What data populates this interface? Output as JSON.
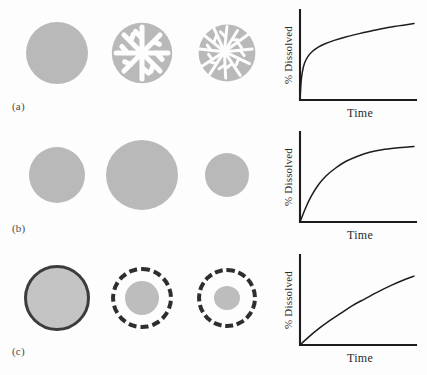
{
  "figure": {
    "panels": [
      {
        "label": "(a)",
        "mechanism": "erosion-fragmentation",
        "stages": [
          "intact-particle",
          "eroding-particle-radial-channels",
          "fragmented-particle"
        ]
      },
      {
        "label": "(b)",
        "mechanism": "swelling-then-shrinking",
        "stages": [
          "initial-particle",
          "swollen-particle",
          "shrunken-particle"
        ]
      },
      {
        "label": "(c)",
        "mechanism": "reservoir-membrane-diffusion",
        "stages": [
          "solid-membrane-sphere",
          "dashed-membrane-large-core",
          "dashed-membrane-small-core"
        ]
      }
    ],
    "colors": {
      "particle_fill": "#b9b9b9",
      "membrane_stroke": "#2e2e2e",
      "axis": "#1d1d1d",
      "background": "#fdfdfd"
    }
  },
  "chart_data": [
    {
      "type": "line",
      "title": "",
      "panel": "(a)",
      "xlabel": "Time",
      "ylabel": "% Dissolved",
      "xlim": [
        0,
        100
      ],
      "ylim": [
        0,
        100
      ],
      "grid": false,
      "legend": false,
      "description": "burst release: very steep initial rise then slow gradual increase",
      "x": [
        0,
        1,
        2,
        4,
        7,
        11,
        16,
        22,
        30,
        40,
        52,
        65,
        80,
        100
      ],
      "y": [
        0,
        22,
        33,
        44,
        52,
        58,
        63,
        67,
        71,
        75,
        79,
        83,
        87,
        91
      ]
    },
    {
      "type": "line",
      "title": "",
      "panel": "(b)",
      "xlabel": "Time",
      "ylabel": "% Dissolved",
      "xlim": [
        0,
        100
      ],
      "ylim": [
        0,
        100
      ],
      "grid": false,
      "legend": false,
      "description": "first-order release rising smoothly from origin and plateauing",
      "x": [
        0,
        5,
        10,
        16,
        23,
        31,
        40,
        50,
        61,
        72,
        84,
        100
      ],
      "y": [
        0,
        17,
        31,
        44,
        55,
        64,
        72,
        78,
        83,
        86,
        88,
        90
      ]
    },
    {
      "type": "line",
      "title": "",
      "panel": "(c)",
      "xlabel": "Time",
      "ylabel": "% Dissolved",
      "xlim": [
        0,
        100
      ],
      "ylim": [
        0,
        100
      ],
      "grid": false,
      "legend": false,
      "description": "near zero-order, almost linear release with slight downward curvature",
      "x": [
        0,
        8,
        17,
        26,
        36,
        46,
        57,
        68,
        80,
        92,
        100
      ],
      "y": [
        0,
        10,
        20,
        29,
        38,
        47,
        55,
        63,
        71,
        78,
        82
      ]
    }
  ]
}
